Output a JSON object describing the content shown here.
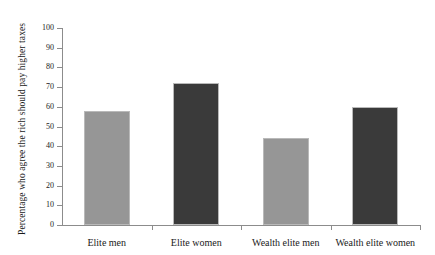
{
  "chart_data": {
    "type": "bar",
    "title": "",
    "subtitle": "",
    "xlabel": "",
    "ylabel": "Percentage who agree the rich should pay higher taxes",
    "categories": [
      "Elite men",
      "Elite women",
      "Wealth elite men",
      "Wealth elite women"
    ],
    "values": [
      58,
      72,
      44,
      60
    ],
    "series": [
      {
        "name": "Percentage who agree the rich should pay higher taxes",
        "values": [
          58,
          72,
          44,
          60
        ]
      }
    ],
    "bar_colors": [
      "#969696",
      "#3a3a3a",
      "#969696",
      "#3a3a3a"
    ],
    "ylim": [
      0,
      100
    ],
    "yticks": [
      0,
      10,
      20,
      30,
      40,
      50,
      60,
      70,
      80,
      90,
      100
    ],
    "ytick_labels": [
      "0",
      "10",
      "20",
      "30",
      "40",
      "50",
      "60",
      "70",
      "80",
      "90",
      "100"
    ],
    "grid": false,
    "legend": false,
    "legend_position": "none",
    "annotations": []
  },
  "style": {
    "background_color": "#ffffff",
    "axis_color": "#8c8c8c",
    "text_color": "#1a1a1a",
    "bar_outline_color": "#b9b9b9",
    "light_bar_color": "#969696",
    "dark_bar_color": "#3a3a3a"
  }
}
